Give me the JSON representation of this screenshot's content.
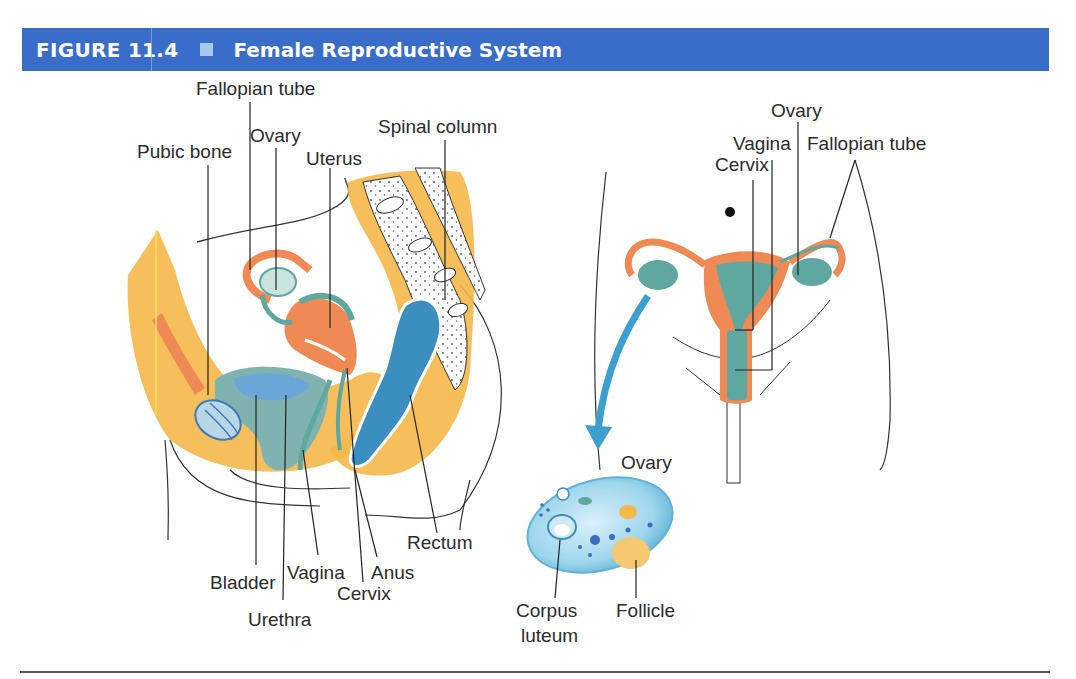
{
  "figure": {
    "number": "FIGURE 11.4",
    "title": "Female Reproductive System",
    "header_color": "#3a6cc9",
    "marker_color": "#a8c8ee"
  },
  "sagittal_view": {
    "labels": {
      "fallopian_tube": "Fallopian tube",
      "ovary": "Ovary",
      "pubic_bone": "Pubic bone",
      "uterus": "Uterus",
      "spinal_column": "Spinal column",
      "rectum": "Rectum",
      "bladder": "Bladder",
      "vagina": "Vagina",
      "anus": "Anus",
      "cervix": "Cervix",
      "urethra": "Urethra"
    }
  },
  "frontal_view": {
    "labels": {
      "ovary": "Ovary",
      "vagina": "Vagina",
      "fallopian_tube": "Fallopian tube",
      "cervix": "Cervix"
    }
  },
  "ovary_detail": {
    "labels": {
      "ovary": "Ovary",
      "corpus_luteum_line1": "Corpus",
      "corpus_luteum_line2": "luteum",
      "follicle": "Follicle"
    }
  },
  "colors": {
    "tissue_yellow": "#f5b84a",
    "tissue_orange": "#f08a55",
    "organ_teal": "#5fa8a0",
    "rectum_blue": "#3a8fc0",
    "bladder_blue": "#6aa6d8",
    "arrow_blue": "#3aa0d0",
    "ovary_detail_blue": "#8ccfe8"
  }
}
